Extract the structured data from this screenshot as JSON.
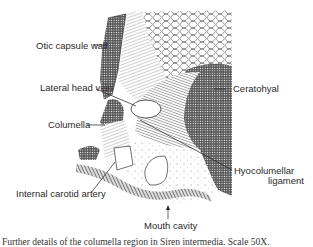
{
  "figure": {
    "labels": {
      "otic_capsule_wall": "Otic capsule wall",
      "lateral_head_vein": "Lateral head vein",
      "columella": "Columella",
      "internal_carotid_artery": "Internal carotid artery",
      "ceratohyal": "Ceratohyal",
      "hyocolumellar_ligament_line1": "Hyocolumellar",
      "hyocolumellar_ligament_line2": "ligament",
      "mouth_cavity": "Mouth cavity"
    },
    "caption": "Further details of the columella region in Siren intermedia. Scale 50X."
  }
}
